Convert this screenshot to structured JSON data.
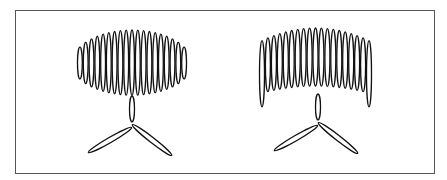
{
  "figure": {
    "panels": [
      {
        "id": "left",
        "coil_shape": "ellipse",
        "loop_count": 19,
        "center_x": 132,
        "coil_top": 28,
        "coil_bottom": 95,
        "coil_left": 77,
        "coil_right": 187
      },
      {
        "id": "right",
        "coil_shape": "arch",
        "loop_count": 19,
        "center_x": 318,
        "coil_top": 28,
        "coil_bottom": 112,
        "coil_left": 259,
        "coil_right": 372
      }
    ],
    "stroke_color": "#111111",
    "border_color": "#555555"
  }
}
